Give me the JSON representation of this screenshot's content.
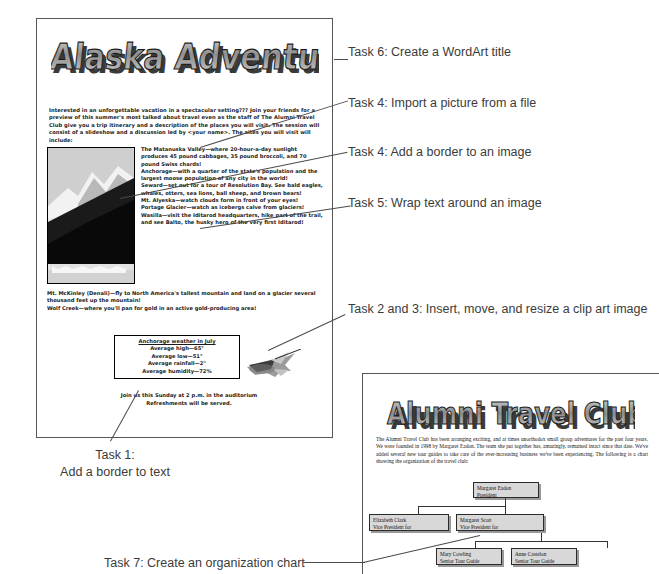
{
  "flyer": {
    "wordart_title": "Alaska Adventure!!",
    "intro": "Interested in an unforgettable vacation in a spectacular setting??? Join your friends for a preview of this summer's most talked about travel even as the staff of The Alumni Travel Club give you a trip itinerary and a description of the places you will visit. The session will consist of a slideshow and a discussion led by <your name>. The sites you will visit will include:",
    "photo_alt": "mountain-glacier-photo",
    "destinations": [
      {
        "name": "The Matanuska Valley",
        "text": "—where 20-hour-a-day sunlight produces 45 pound cabbages, 35 pound broccoli, and 70 pound Swiss chards!"
      },
      {
        "name": "Anchorage",
        "text": "—with a quarter of the state's population and the largest moose population of any city in the world!"
      },
      {
        "name": "Seward",
        "text": "—set out for a tour of Resolution Bay. See bald eagles, whales, otters, sea lions, ball sheep, and brown bears!"
      },
      {
        "name": "Mt. Alyeska",
        "text": "—watch clouds form in front of your eyes!"
      },
      {
        "name": "Portage Glacier",
        "text": "—watch as icebergs calve from glaciers!"
      },
      {
        "name": "Wasilla",
        "text": "—visit the Iditarod headquarters, hike part of the trail, and see Balto, the husky hero of the very first Iditarod!"
      }
    ],
    "destinations_full": [
      {
        "name": "Mt. McKinley (Denali)",
        "text": "—fly to North America's tallest mountain and land on a glacier several thousand feet up the mountain!"
      },
      {
        "name": "Wolf Creek",
        "text": "—where you'll pan for gold in an active gold-producing area!"
      }
    ],
    "weather": {
      "title": "Anchorage weather in July",
      "rows": [
        "Average high—65°",
        "Average low—51°",
        "Average rainfall—2\"",
        "Average humidity—72%"
      ]
    },
    "closing_line1": "Join us this Sunday at 2 p.m. in the auditorium",
    "closing_line2": "Refreshments will be served.",
    "clipart_alt": "airplane-clip-art"
  },
  "alumni": {
    "wordart_title": "Alumni Travel Club",
    "body": "The Alumni Travel Club has been arranging exciting, and at times unorthodox small group adventures for the past four years. We were founded in 1998 by Margaret Eadon. The team she put together has, amazingly, remained intact since that date. We've added several new tour guides to take care of the ever-increasing business we've been experiencing. The following is a chart showing the organization of the travel club:",
    "org_chart": {
      "root": {
        "name": "Margaret Eadon",
        "title": "President"
      },
      "level2": [
        {
          "name": "Elizabeth Clark",
          "title": "Vice President for"
        },
        {
          "name": "Margaret Scott",
          "title": "Vice President for"
        }
      ],
      "level3": [
        {
          "name": "Mary Cowling",
          "title": "Senior Tour Guide"
        },
        {
          "name": "Anne Castelon",
          "title": "Senior Tour Guide"
        }
      ]
    }
  },
  "annotations": {
    "task6": "Task 6: Create a WordArt title",
    "task4a": "Task 4: Import a picture from a file",
    "task4b": "Task 4: Add a border to an image",
    "task5": "Task 5: Wrap text around an image",
    "task23": "Task 2 and 3: Insert, move, and resize a clip art image",
    "task1_line1": "Task 1:",
    "task1_line2": "Add a border to text",
    "task7": "Task 7: Create an organization chart"
  },
  "colors": {
    "wordart_fill": "#9a9a9a",
    "wordart_shadow": "#3a3a3a",
    "box_fill": "#d8d8d8",
    "annotation_text": "#3b3b3b",
    "page_border": "#555555"
  }
}
